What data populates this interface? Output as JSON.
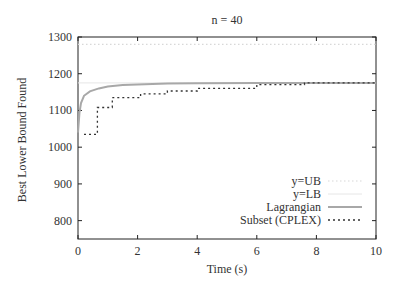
{
  "chart_data": {
    "type": "line",
    "title": "n = 40",
    "xlabel": "Time (s)",
    "ylabel": "Best Lower Bound Found",
    "xlim": [
      0,
      10
    ],
    "ylim": [
      750,
      1300
    ],
    "xticks": [
      "0",
      "2",
      "4",
      "6",
      "8",
      "10"
    ],
    "yticks": [
      "800",
      "900",
      "1000",
      "1100",
      "1200",
      "1300"
    ],
    "grid": false,
    "legend_position": "lower right",
    "series": [
      {
        "name": "y=UB",
        "style": "dotted-light",
        "x": [
          0,
          10
        ],
        "y": [
          1280,
          1280
        ]
      },
      {
        "name": "y=LB",
        "style": "solid-light",
        "x": [
          0,
          10
        ],
        "y": [
          1175,
          1175
        ]
      },
      {
        "name": "Lagrangian",
        "style": "solid-gray",
        "x": [
          0,
          0.05,
          0.1,
          0.2,
          0.4,
          0.7,
          1.0,
          1.5,
          2,
          3,
          4,
          6,
          8,
          10
        ],
        "y": [
          1040,
          1095,
          1120,
          1140,
          1152,
          1160,
          1165,
          1169,
          1171,
          1173,
          1174,
          1175,
          1175,
          1175
        ]
      },
      {
        "name": "Subset (CPLEX)",
        "style": "dotted-black-step",
        "x": [
          0.2,
          0.65,
          0.65,
          1.15,
          1.15,
          2.1,
          2.1,
          3.0,
          3.0,
          4.0,
          4.0,
          6.0,
          6.0,
          7.6,
          7.6,
          10
        ],
        "y": [
          1035,
          1035,
          1108,
          1108,
          1135,
          1135,
          1145,
          1145,
          1153,
          1153,
          1160,
          1160,
          1170,
          1170,
          1175,
          1175
        ]
      }
    ]
  }
}
